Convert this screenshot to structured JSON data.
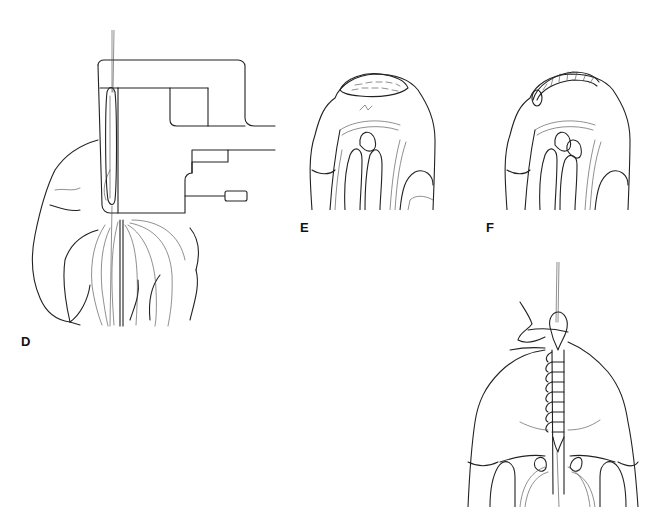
{
  "figure": {
    "panels": [
      {
        "id": "D",
        "label": "D",
        "description": "Clamp instrument applied across tissue with suture thread"
      },
      {
        "id": "E",
        "label": "E",
        "description": "Tissue with staple line (dashed) along top edge"
      },
      {
        "id": "F",
        "label": "F",
        "description": "Tissue with oversewn staple line along top edge"
      },
      {
        "id": "G",
        "label": "",
        "description": "Running suture closure along midline with needle and thread"
      }
    ],
    "caption": "",
    "colors": {
      "ink": "#222222",
      "background": "#ffffff"
    }
  }
}
